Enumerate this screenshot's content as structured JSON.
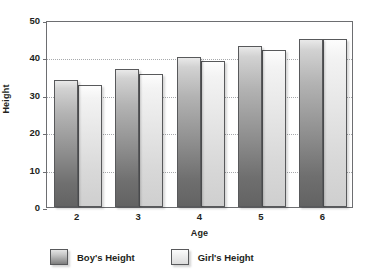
{
  "chart_data": {
    "type": "bar",
    "title": "",
    "subtitle": "",
    "xlabel": "Age",
    "ylabel": "Height",
    "categories": [
      "2",
      "3",
      "4",
      "5",
      "6"
    ],
    "series": [
      {
        "name": "Boy's Height",
        "values": [
          34,
          37,
          40,
          43,
          45
        ],
        "color": "#8d8d8d"
      },
      {
        "name": "Girl's Height",
        "values": [
          32.5,
          35.5,
          39,
          42,
          44.8
        ],
        "color": "#e6e6e6"
      }
    ],
    "ylim": [
      0,
      50
    ],
    "y_ticks": [
      0,
      10,
      20,
      30,
      40,
      50
    ],
    "y_tick_labels": [
      "0",
      "10",
      "20",
      "30",
      "40",
      "50"
    ],
    "grid": true,
    "grid_axis": "y",
    "legend_position": "bottom",
    "bar_mode": "grouped"
  },
  "legend": {
    "entries": [
      {
        "label": "Boy's Height",
        "swatch": "boy"
      },
      {
        "label": "Girl's Height",
        "swatch": "girl"
      }
    ]
  },
  "axes": {
    "x_title": "Age",
    "y_title": "Height"
  },
  "colors": {
    "axis": "#6d6e71",
    "grid": "#a7a9ac",
    "text": "#231f20",
    "boy_bar": "#8d8d8d",
    "girl_bar": "#e6e6e6"
  }
}
